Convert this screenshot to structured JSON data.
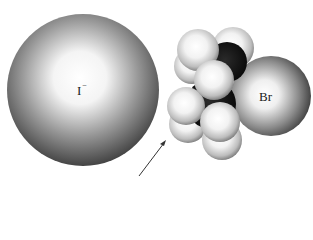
{
  "diagram": {
    "type": "space-filling molecular model",
    "atoms": {
      "nucleophile": {
        "label": "I",
        "charge": "−"
      },
      "leaving_group": {
        "label": "Br"
      },
      "carbons": 2,
      "hydrogens": 8
    },
    "arrow": {
      "meaning": "direction of backside attack"
    },
    "colors": {
      "iodide_edge": "#3c3c3c",
      "iodide_center": "#ffffff",
      "bromine_edge": "#3a3a3a",
      "hydrogen_edge": "#8a8a8a",
      "carbon": "#111111",
      "arrow": "#333333"
    }
  }
}
